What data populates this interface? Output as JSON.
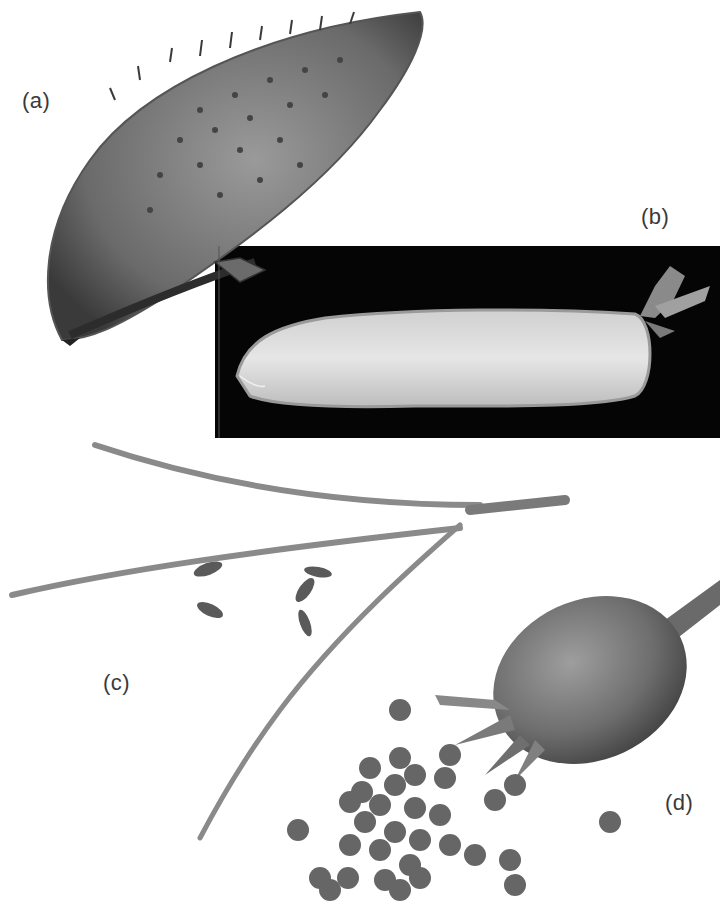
{
  "figure": {
    "panels": [
      {
        "id": "a",
        "label": "(a)",
        "subject": "spiny winged seed (achene with bristles)",
        "background": "#ffffff"
      },
      {
        "id": "b",
        "label": "(b)",
        "subject": "hairy legume pod with persistent calyx",
        "background": "#050505"
      },
      {
        "id": "c",
        "label": "(c)",
        "subject": "dehisced slender siliques with scattered elongated seeds",
        "background": "#ffffff"
      },
      {
        "id": "d",
        "label": "(d)",
        "subject": "rounded fruit with sepals and scattered round seeds",
        "background": "#ffffff"
      }
    ],
    "colors": {
      "page_background": "#ffffff",
      "label_text": "#3a3a3a",
      "panel_b_background": "#050505",
      "specimen_dark": "#4a4a4a",
      "specimen_mid": "#7a7a7a",
      "specimen_light": "#d8d8d8"
    }
  }
}
